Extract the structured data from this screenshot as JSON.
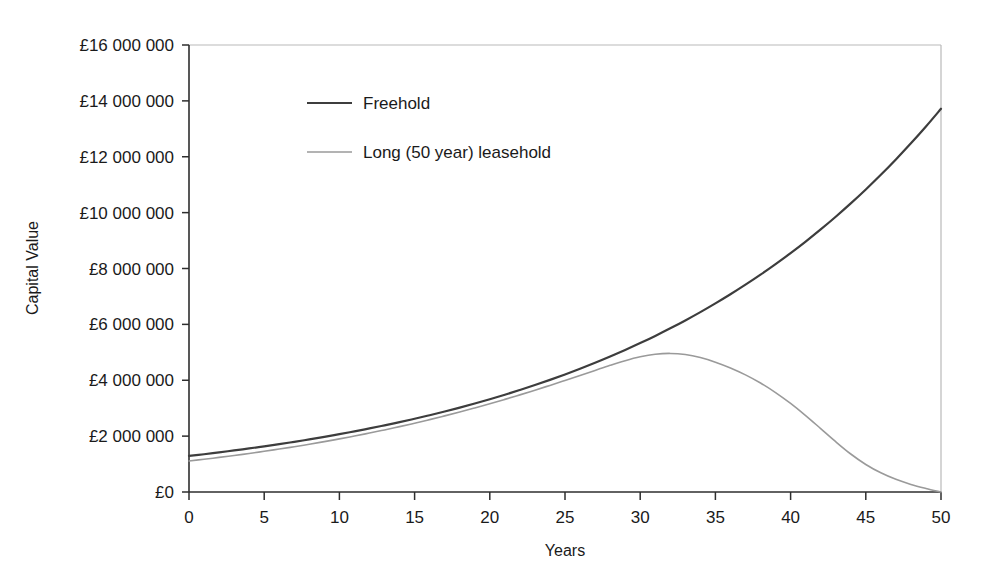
{
  "chart_data": {
    "type": "line",
    "title": "",
    "xlabel": "Years",
    "ylabel": "Capital Value",
    "xlim": [
      0,
      50
    ],
    "ylim": [
      0,
      16000000
    ],
    "grid": false,
    "legend_position": "inside-top-left",
    "x_ticks": [
      0,
      5,
      10,
      15,
      20,
      25,
      30,
      35,
      40,
      45,
      50
    ],
    "x_tick_labels": [
      "0",
      "5",
      "10",
      "15",
      "20",
      "25",
      "30",
      "35",
      "40",
      "45",
      "50"
    ],
    "y_ticks": [
      0,
      2000000,
      4000000,
      6000000,
      8000000,
      10000000,
      12000000,
      14000000,
      16000000
    ],
    "y_tick_labels": [
      "£0",
      "£2 000 000",
      "£4 000 000",
      "£6 000 000",
      "£8 000 000",
      "£10 000 000",
      "£12 000 000",
      "£14 000 000",
      "£16 000 000"
    ],
    "x": [
      0,
      1,
      2,
      3,
      4,
      5,
      6,
      7,
      8,
      9,
      10,
      11,
      12,
      13,
      14,
      15,
      16,
      17,
      18,
      19,
      20,
      21,
      22,
      23,
      24,
      25,
      26,
      27,
      28,
      29,
      30,
      31,
      32,
      33,
      34,
      35,
      36,
      37,
      38,
      39,
      40,
      41,
      42,
      43,
      44,
      45,
      46,
      47,
      48,
      49,
      50
    ],
    "series": [
      {
        "name": "Freehold",
        "color": "#3d3d3d",
        "width": 2.2,
        "values": [
          1290000,
          1352000,
          1418000,
          1487000,
          1559000,
          1634000,
          1713000,
          1796000,
          1883000,
          1974000,
          2070000,
          2170000,
          2275000,
          2385000,
          2501000,
          2622000,
          2749000,
          2882000,
          3022000,
          3168000,
          3321000,
          3482000,
          3651000,
          3828000,
          4013000,
          4207000,
          4411000,
          4624000,
          4848000,
          5083000,
          5329000,
          5587000,
          5858000,
          6141000,
          6438000,
          6750000,
          7077000,
          7420000,
          7779000,
          8156000,
          8550000,
          8964000,
          9398000,
          9853000,
          10330000,
          10830000,
          11354000,
          11904000,
          12480000,
          13084000,
          13717000
        ]
      },
      {
        "name": "Long (50 year) leasehold",
        "color": "#9a9a9a",
        "width": 1.6,
        "values": [
          1110000,
          1172000,
          1238000,
          1307000,
          1380000,
          1456000,
          1537000,
          1621000,
          1710000,
          1803000,
          1901000,
          2003000,
          2110000,
          2222000,
          2340000,
          2462000,
          2590000,
          2724000,
          2863000,
          3008000,
          3159000,
          3315000,
          3477000,
          3644000,
          3816000,
          3992000,
          4172000,
          4353000,
          4533000,
          4700000,
          4838000,
          4930000,
          4960000,
          4920000,
          4812000,
          4648000,
          4440000,
          4192000,
          3900000,
          3560000,
          3170000,
          2736000,
          2270000,
          1800000,
          1360000,
          985000,
          686000,
          452000,
          272000,
          128000,
          0
        ]
      }
    ],
    "legend": [
      {
        "label": "Freehold",
        "color": "#3d3d3d",
        "width": 2.2
      },
      {
        "label": "Long (50 year) leasehold",
        "color": "#9a9a9a",
        "width": 1.6
      }
    ]
  }
}
